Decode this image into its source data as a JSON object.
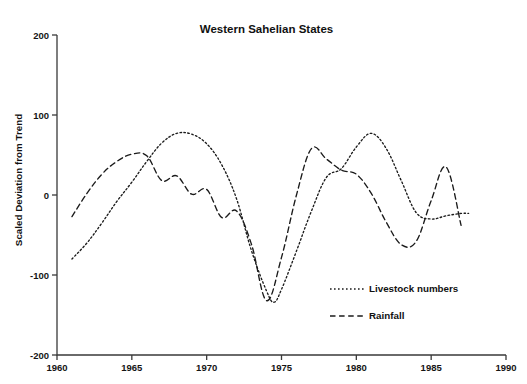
{
  "chart_data": {
    "type": "line",
    "title": "Western Sahelian States",
    "xlabel": "",
    "ylabel": "Scaled Deviation from Trend",
    "xlim": [
      1960,
      1990
    ],
    "ylim": [
      -200,
      200
    ],
    "grid": false,
    "legend_position": "inside-lower-right",
    "xticks": [
      "1960",
      "1965",
      "1970",
      "1975",
      "1980",
      "1985",
      "1990"
    ],
    "xtick_values": [
      1960,
      1965,
      1970,
      1975,
      1980,
      1985,
      1990
    ],
    "yticks": [
      "200",
      "100",
      "0",
      "-100",
      "-200"
    ],
    "ytick_values": [
      200,
      100,
      0,
      -100,
      -200
    ],
    "series": [
      {
        "name": "Livestock numbers",
        "style": "dotted",
        "color": "#1b1b1b",
        "x": [
          1961,
          1962,
          1963,
          1964,
          1965,
          1966,
          1967,
          1968,
          1969,
          1970,
          1971,
          1972,
          1973,
          1974,
          1974.5,
          1975,
          1976,
          1977,
          1978,
          1979,
          1980,
          1981,
          1982,
          1983,
          1984,
          1985,
          1986,
          1987,
          1987.5
        ],
        "y": [
          -80,
          -60,
          -35,
          -8,
          16,
          42,
          65,
          77,
          76,
          64,
          38,
          -5,
          -70,
          -120,
          -134,
          -118,
          -70,
          -20,
          22,
          33,
          60,
          77,
          58,
          18,
          -22,
          -30,
          -26,
          -23,
          -23
        ]
      },
      {
        "name": "Rainfall",
        "style": "dashed",
        "color": "#1b1b1b",
        "x": [
          1961,
          1962,
          1963,
          1964,
          1965,
          1966,
          1967,
          1968,
          1969,
          1970,
          1971,
          1972,
          1973,
          1974,
          1975,
          1976,
          1977,
          1978,
          1979,
          1980,
          1981,
          1982,
          1983,
          1984,
          1985,
          1986,
          1987
        ],
        "y": [
          -27,
          2,
          26,
          42,
          51,
          49,
          18,
          24,
          1,
          7,
          -28,
          -20,
          -62,
          -132,
          -78,
          0,
          58,
          45,
          31,
          26,
          2,
          -34,
          -62,
          -58,
          -7,
          35,
          -38
        ]
      }
    ]
  },
  "legend": {
    "items": [
      {
        "label": "Livestock numbers",
        "style": "dotted"
      },
      {
        "label": "Rainfall",
        "style": "dashed"
      }
    ]
  }
}
